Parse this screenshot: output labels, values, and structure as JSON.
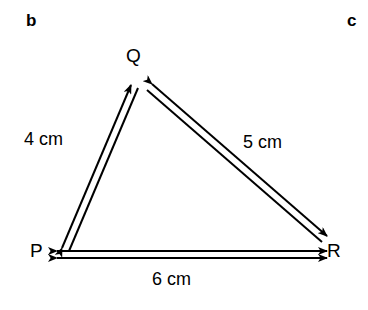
{
  "figure": {
    "part_labels": {
      "left": "b",
      "right": "c"
    },
    "vertices": [
      {
        "name": "Q",
        "label": "Q",
        "x": 140,
        "y": 78
      },
      {
        "name": "P",
        "label": "P",
        "x": 50,
        "y": 252
      },
      {
        "name": "R",
        "label": "R",
        "x": 330,
        "y": 252
      }
    ],
    "sides": [
      {
        "name": "PQ",
        "label": "4 cm",
        "from": "P",
        "to": "Q",
        "arrows": "both"
      },
      {
        "name": "QR",
        "label": "5 cm",
        "from": "Q",
        "to": "R",
        "arrows": "both"
      },
      {
        "name": "PR",
        "label": "6 cm",
        "from": "P",
        "to": "R",
        "arrows": "both"
      }
    ],
    "stroke_color": "#000000",
    "background_color": "#ffffff"
  }
}
